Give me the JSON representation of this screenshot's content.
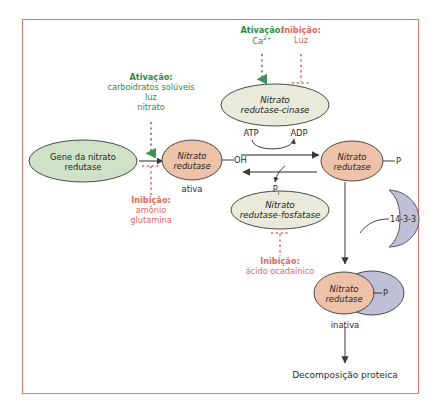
{
  "diagram": {
    "title_visible": false,
    "frame_color": "#e0766b",
    "palette": {
      "green_fill": "#cfe2c8",
      "green_text": "#2f8a4a",
      "peach_fill": "#eec2a8",
      "cream_fill": "#eaeada",
      "purple_fill": "#c0bfd8",
      "red_text": "#e0685c",
      "stroke": "#4a4a4a"
    }
  },
  "nodes": {
    "gene": {
      "line1": "Gene da nitrato",
      "line2": "redutase",
      "fill": "#cfe2c8"
    },
    "kinase": {
      "line1": "Nitrato",
      "line2": "redutase-cinase",
      "fill": "#eaeada"
    },
    "nr_active": {
      "line1": "Nitrato",
      "line2": "redutase",
      "fill": "#eec2a8"
    },
    "nr_phospho": {
      "line1": "Nitrato",
      "line2": "redutase",
      "fill": "#eec2a8"
    },
    "phosphatase": {
      "line1": "Nitrato",
      "line2": "redutase-fosfatase",
      "fill": "#eaeada"
    },
    "nr_inactive": {
      "line1": "Nitrato",
      "line2": "redutase",
      "fill": "#eec2a8"
    },
    "protein_1433": {
      "label": "14-3-3",
      "fill": "#c0bfd8"
    }
  },
  "labels": {
    "oh": "OH",
    "p_right": "P",
    "p_complex": "P",
    "atp": "ATP",
    "adp": "ADP",
    "pi_main": "P",
    "pi_sub": "i",
    "state_active": "ativa",
    "state_inactive": "inativa",
    "outcome": "Decomposição proteica"
  },
  "regulators": {
    "gene_activation": {
      "title": "Ativação:",
      "items": [
        "carboidratos solúveis",
        "luz",
        "nitrato"
      ],
      "kind": "activation"
    },
    "gene_inhibition": {
      "title": "Inibição:",
      "items": [
        "amônio",
        "glutamina"
      ],
      "kind": "inhibition"
    },
    "kinase_activation": {
      "title": "Ativação:",
      "item_main": "Ca",
      "item_sup": "2+",
      "kind": "activation"
    },
    "kinase_inhibition": {
      "title": "Inibição:",
      "items": [
        "Luz"
      ],
      "kind": "inhibition"
    },
    "phosphatase_inhibition": {
      "title": "Inibição:",
      "items": [
        "ácido ocadaínico"
      ],
      "kind": "inhibition"
    }
  }
}
